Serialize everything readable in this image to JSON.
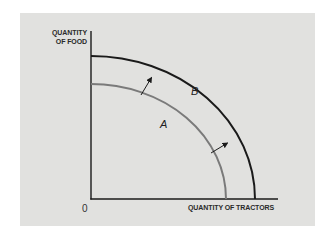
{
  "diagram": {
    "type": "production-possibilities-frontier",
    "y_axis_label_line1": "QUANTITY",
    "y_axis_label_line2": "OF FOOD",
    "x_axis_label": "QUANTITY OF TRACTORS",
    "origin_label": "0",
    "curves": [
      {
        "name": "A",
        "label": "A",
        "color": "#7a7a7a",
        "description": "inner frontier"
      },
      {
        "name": "B",
        "label": "B",
        "color": "#1a1a1a",
        "description": "outer frontier"
      }
    ],
    "arrows": [
      {
        "from": "A",
        "to": "B",
        "position": "upper"
      },
      {
        "from": "A",
        "to": "B",
        "position": "lower"
      }
    ],
    "colors": {
      "background": "#e1e1df",
      "axis": "#1a1a1a",
      "curve_a": "#7a7a7a",
      "curve_b": "#1a1a1a"
    }
  }
}
